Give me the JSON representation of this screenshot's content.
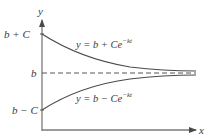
{
  "diagram": {
    "axes": {
      "x_label": "x",
      "y_label": "y"
    },
    "tick_labels": {
      "upper": "b + C",
      "middle": "b",
      "lower": "b − C"
    },
    "curves": [
      {
        "name": "decay-above",
        "equation_base": "y = b + Ce",
        "exponent": "−kt",
        "start": "b + C",
        "asymptote": "b"
      },
      {
        "name": "growth-below",
        "equation_base": "y = b − Ce",
        "exponent": "−kt",
        "start": "b − C",
        "asymptote": "b"
      }
    ],
    "asymptote_style": "dashed",
    "colors": {
      "axis": "#6b6b6b",
      "curve": "#4a4a4a",
      "text": "#3a3a3a"
    }
  }
}
